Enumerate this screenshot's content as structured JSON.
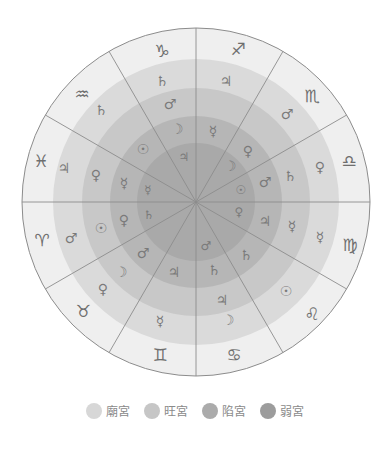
{
  "center": [
    196,
    202
  ],
  "rings": [
    {
      "name": "sign-ring",
      "r": 174,
      "color": "#efefef"
    },
    {
      "name": "rulership-ring",
      "r": 143,
      "color": "#dadada"
    },
    {
      "name": "exaltation-ring",
      "r": 114,
      "color": "#c8c8c8"
    },
    {
      "name": "detriment-ring",
      "r": 86,
      "color": "#b6b6b6"
    },
    {
      "name": "fall-ring",
      "r": 59,
      "color": "#a9a9a9"
    }
  ],
  "spoke_color": "#8c8c8c",
  "signs": [
    {
      "name": "capricorn",
      "glyph": "♑",
      "x": 162,
      "y": 51
    },
    {
      "name": "sagittarius",
      "glyph": "♐",
      "x": 238,
      "y": 49
    },
    {
      "name": "scorpio",
      "glyph": "♏",
      "x": 312,
      "y": 96
    },
    {
      "name": "libra",
      "glyph": "♎",
      "x": 349,
      "y": 161
    },
    {
      "name": "virgo",
      "glyph": "♍",
      "x": 350,
      "y": 245
    },
    {
      "name": "leo",
      "glyph": "♌",
      "x": 312,
      "y": 314
    },
    {
      "name": "cancer",
      "glyph": "♋",
      "x": 234,
      "y": 355
    },
    {
      "name": "gemini",
      "glyph": "♊",
      "x": 160,
      "y": 355
    },
    {
      "name": "taurus",
      "glyph": "♉",
      "x": 83,
      "y": 311
    },
    {
      "name": "aries",
      "glyph": "♈",
      "x": 42,
      "y": 240
    },
    {
      "name": "pisces",
      "glyph": "♓",
      "x": 41,
      "y": 161
    },
    {
      "name": "aquarius",
      "glyph": "♒",
      "x": 82,
      "y": 94
    }
  ],
  "planets": [
    {
      "ring": "rulership",
      "name": "saturn",
      "glyph": "♄",
      "x": 162,
      "y": 81
    },
    {
      "ring": "rulership",
      "name": "jupiter",
      "glyph": "♃",
      "x": 226,
      "y": 81
    },
    {
      "ring": "rulership",
      "name": "mars",
      "glyph": "♂",
      "x": 287,
      "y": 114
    },
    {
      "ring": "rulership",
      "name": "venus",
      "glyph": "♀",
      "x": 320,
      "y": 167
    },
    {
      "ring": "rulership",
      "name": "mercury",
      "glyph": "☿",
      "x": 320,
      "y": 237
    },
    {
      "ring": "rulership",
      "name": "sun",
      "glyph": "☉",
      "x": 286,
      "y": 291
    },
    {
      "ring": "rulership",
      "name": "moon",
      "glyph": "☽",
      "x": 228,
      "y": 320
    },
    {
      "ring": "rulership",
      "name": "mercury",
      "glyph": "☿",
      "x": 160,
      "y": 321
    },
    {
      "ring": "rulership",
      "name": "venus",
      "glyph": "♀",
      "x": 103,
      "y": 289
    },
    {
      "ring": "rulership",
      "name": "mars",
      "glyph": "♂",
      "x": 71,
      "y": 238
    },
    {
      "ring": "rulership",
      "name": "jupiter",
      "glyph": "♃",
      "x": 64,
      "y": 168
    },
    {
      "ring": "rulership",
      "name": "saturn",
      "glyph": "♄",
      "x": 101,
      "y": 110
    },
    {
      "ring": "exaltation",
      "name": "mars",
      "glyph": "♂",
      "x": 170,
      "y": 104
    },
    {
      "ring": "exaltation",
      "name": "venus",
      "glyph": "♀",
      "x": 248,
      "y": 151
    },
    {
      "ring": "exaltation",
      "name": "saturn",
      "glyph": "♄",
      "x": 290,
      "y": 176
    },
    {
      "ring": "exaltation",
      "name": "mercury",
      "glyph": "☿",
      "x": 292,
      "y": 226
    },
    {
      "ring": "exaltation",
      "name": "saturn",
      "glyph": "♄",
      "x": 246,
      "y": 255
    },
    {
      "ring": "exaltation",
      "name": "jupiter",
      "glyph": "♃",
      "x": 222,
      "y": 300
    },
    {
      "ring": "exaltation",
      "name": "moon",
      "glyph": "☽",
      "x": 121,
      "y": 272
    },
    {
      "ring": "exaltation",
      "name": "sun",
      "glyph": "☉",
      "x": 101,
      "y": 228
    },
    {
      "ring": "exaltation",
      "name": "venus",
      "glyph": "♀",
      "x": 96,
      "y": 175
    },
    {
      "ring": "detriment",
      "name": "moon",
      "glyph": "☽",
      "x": 177,
      "y": 129
    },
    {
      "ring": "detriment",
      "name": "mercury",
      "glyph": "☿",
      "x": 213,
      "y": 131
    },
    {
      "ring": "detriment",
      "name": "moon",
      "glyph": "☽",
      "x": 230,
      "y": 166
    },
    {
      "ring": "detriment",
      "name": "mars",
      "glyph": "♂",
      "x": 265,
      "y": 182
    },
    {
      "ring": "detriment",
      "name": "jupiter",
      "glyph": "♃",
      "x": 265,
      "y": 221
    },
    {
      "ring": "detriment",
      "name": "saturn",
      "glyph": "♄",
      "x": 214,
      "y": 270
    },
    {
      "ring": "detriment",
      "name": "jupiter",
      "glyph": "♃",
      "x": 174,
      "y": 272
    },
    {
      "ring": "detriment",
      "name": "mars",
      "glyph": "♂",
      "x": 143,
      "y": 253
    },
    {
      "ring": "detriment",
      "name": "venus",
      "glyph": "♀",
      "x": 124,
      "y": 220
    },
    {
      "ring": "detriment",
      "name": "mercury",
      "glyph": "☿",
      "x": 124,
      "y": 183
    },
    {
      "ring": "detriment",
      "name": "sun",
      "glyph": "☉",
      "x": 143,
      "y": 149
    },
    {
      "ring": "fall",
      "name": "jupiter",
      "glyph": "♃",
      "x": 184,
      "y": 157
    },
    {
      "ring": "fall",
      "name": "sun",
      "glyph": "☉",
      "x": 241,
      "y": 190
    },
    {
      "ring": "fall",
      "name": "venus",
      "glyph": "♀",
      "x": 239,
      "y": 212
    },
    {
      "ring": "fall",
      "name": "mars",
      "glyph": "♂",
      "x": 206,
      "y": 246
    },
    {
      "ring": "fall",
      "name": "saturn",
      "glyph": "♄",
      "x": 149,
      "y": 215
    },
    {
      "ring": "fall",
      "name": "mercury",
      "glyph": "☿",
      "x": 148,
      "y": 190
    }
  ],
  "legend": [
    {
      "label": "廟宮",
      "color": "#d7d7d7"
    },
    {
      "label": "旺宮",
      "color": "#c6c6c6"
    },
    {
      "label": "陷宮",
      "color": "#ababab"
    },
    {
      "label": "弱宮",
      "color": "#9c9c9c"
    }
  ]
}
